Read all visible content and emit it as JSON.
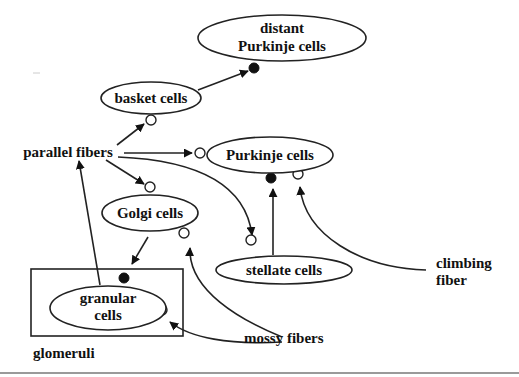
{
  "diagram": {
    "type": "cerebellar-circuit",
    "nodes": {
      "distant_purkinje": {
        "line1": "distant",
        "line2": "Purkinje cells"
      },
      "basket": {
        "label": "basket cells"
      },
      "parallel_fibers": {
        "label": "parallel fibers"
      },
      "purkinje": {
        "label": "Purkinje cells"
      },
      "golgi": {
        "label": "Golgi cells"
      },
      "stellate": {
        "label": "stellate cells"
      },
      "granular": {
        "line1": "granular",
        "line2": "cells"
      },
      "mossy_fibers": {
        "label": "mossy fibers"
      },
      "climbing_fiber": {
        "line1": "climbing",
        "line2": "fiber"
      },
      "glomeruli": {
        "label": "glomeruli"
      }
    },
    "edges": [
      {
        "from": "basket cells",
        "to": "distant Purkinje cells",
        "synapse": "inhibitory"
      },
      {
        "from": "parallel fibers",
        "to": "basket cells",
        "synapse": "excitatory"
      },
      {
        "from": "parallel fibers",
        "to": "Purkinje cells",
        "synapse": "excitatory"
      },
      {
        "from": "parallel fibers",
        "to": "Golgi cells",
        "synapse": "excitatory"
      },
      {
        "from": "parallel fibers",
        "to": "stellate cells",
        "synapse": "excitatory"
      },
      {
        "from": "stellate cells",
        "to": "Purkinje cells",
        "synapse": "inhibitory"
      },
      {
        "from": "climbing fiber",
        "to": "Purkinje cells",
        "synapse": "excitatory"
      },
      {
        "from": "Golgi cells",
        "to": "granular cells",
        "synapse": "inhibitory"
      },
      {
        "from": "mossy fibers",
        "to": "Golgi cells",
        "synapse": "excitatory"
      },
      {
        "from": "mossy fibers",
        "to": "granular cells",
        "synapse": "excitatory"
      },
      {
        "from": "granular cells",
        "to": "parallel fibers",
        "synapse": "none"
      }
    ],
    "legend": {
      "open_circle": "excitatory synapse",
      "filled_circle": "inhibitory synapse"
    }
  }
}
